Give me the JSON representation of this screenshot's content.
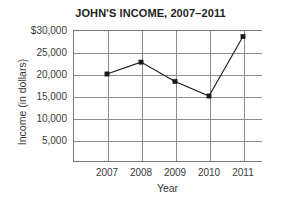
{
  "chart_data": {
    "type": "line",
    "title": "JOHN'S INCOME, 2007–2011",
    "xlabel": "Year",
    "ylabel": "Income (in dollars)",
    "categories": [
      "2007",
      "2008",
      "2009",
      "2010",
      "2011"
    ],
    "values": [
      20000,
      22700,
      18300,
      15000,
      28500
    ],
    "series": [
      {
        "name": "Income",
        "values": [
          20000,
          22700,
          18300,
          15000,
          28500
        ]
      }
    ],
    "ylim": [
      0,
      30000
    ],
    "ytick_values": [
      5000,
      10000,
      15000,
      20000,
      25000,
      30000
    ],
    "ytick_labels": [
      "5,000",
      "10,000",
      "15,000",
      "20,000",
      "25,000",
      "$30,000"
    ],
    "xtick_labels": [
      "2007",
      "2008",
      "2009",
      "2010",
      "2011"
    ],
    "grid": true,
    "legend": null,
    "marker": "square",
    "line_color": "#1a1a1a",
    "grid_color": "#8d8d8d",
    "axis_color": "#7a7a7a",
    "background_color": "#ffffff"
  }
}
